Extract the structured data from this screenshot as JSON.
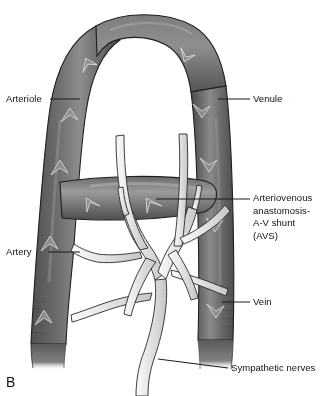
{
  "figure": {
    "panel_letter": "B",
    "background_color": "#ffffff",
    "vessel_color_dark": "#585858",
    "vessel_color_mid": "#6f6f6f",
    "vessel_color_light": "#9a9a9a",
    "nerve_color": "#e8e8e8",
    "outline_color": "#1a1a1a",
    "leader_line_color": "#1a1a1a"
  },
  "labels": {
    "arteriole": "Arteriole",
    "artery": "Artery",
    "venule": "Venule",
    "arteriovenous_anastomosis": "Arteriovenous\nanastomosis-\nA-V shunt\n(AVS)",
    "vein": "Vein",
    "sympathetic_nerves": "Sympathetic nerves"
  },
  "structures": [
    {
      "name": "arteriole",
      "side": "left",
      "flow_direction": "upward",
      "arrow_count": 3,
      "description": "Left ascending limb of vascular arch"
    },
    {
      "name": "artery",
      "side": "left",
      "flow_direction": "upward",
      "arrow_count": 2,
      "description": "Lower left thick vessel"
    },
    {
      "name": "venule",
      "side": "right",
      "flow_direction": "downward",
      "arrow_count": 3,
      "description": "Right descending limb of vascular arch"
    },
    {
      "name": "vein",
      "side": "right",
      "flow_direction": "downward",
      "arrow_count": 2,
      "description": "Lower right thick vessel"
    },
    {
      "name": "arteriovenous-anastomosis",
      "side": "center",
      "flow_direction": "rightward",
      "arrow_count": 2,
      "description": "Horizontal shunt vessel connecting artery to vein"
    },
    {
      "name": "sympathetic-nerves",
      "side": "center-bottom",
      "flow_direction": "branching-upward",
      "arrow_count": 0,
      "description": "Pale branching nerve tree arising from bottom center"
    }
  ]
}
